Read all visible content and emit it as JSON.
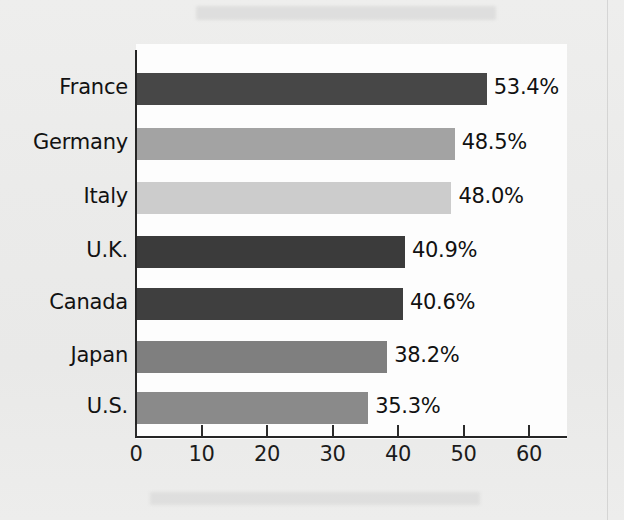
{
  "chart_data": {
    "type": "bar",
    "orientation": "horizontal",
    "title": "",
    "subtitle": "",
    "xlabel": "",
    "ylabel": "",
    "categories": [
      "France",
      "Germany",
      "Italy",
      "U.K.",
      "Canada",
      "Japan",
      "U.S."
    ],
    "values": [
      53.4,
      48.5,
      48.0,
      40.9,
      40.6,
      38.2,
      35.3
    ],
    "value_labels": [
      "53.4%",
      "48.5%",
      "48.0%",
      "40.9%",
      "40.6%",
      "38.2%",
      "35.3%"
    ],
    "bar_colors": [
      "#474747",
      "#a3a3a3",
      "#cccccc",
      "#3b3b3b",
      "#3f3f3f",
      "#7f7f7f",
      "#8a8a8a"
    ],
    "xlim": [
      0,
      60
    ],
    "xticks": [
      0,
      10,
      20,
      30,
      40,
      50,
      60
    ],
    "xtick_labels": [
      "0",
      "10",
      "20",
      "30",
      "40",
      "50",
      "60"
    ],
    "grid": false,
    "legend": null,
    "units": "percent"
  },
  "panel": {
    "background": "#fdfdfd",
    "axis_color": "#252525"
  },
  "page": {
    "background": "#ececeb"
  }
}
